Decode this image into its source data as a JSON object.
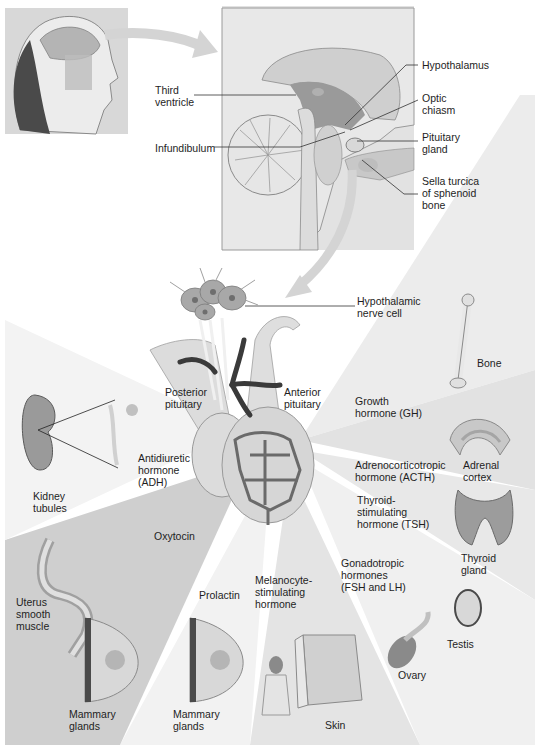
{
  "diagram": {
    "labels": {
      "hypothalamus": "Hypothalamus",
      "third_ventricle": "Third\nventricle",
      "optic_chiasm": "Optic\nchiasm",
      "pituitary_gland": "Pituitary\ngland",
      "infundibulum": "Infundibulum",
      "sella_turcica": "Sella turcica\nof sphenoid\nbone",
      "hypothalamic_nerve_cell": "Hypothalamic\nnerve cell",
      "posterior_pituitary": "Posterior\npituitary",
      "anterior_pituitary": "Anterior\npituitary",
      "bone": "Bone",
      "growth_hormone": "Growth\nhormone (GH)",
      "adrenal_cortex": "Adrenal\ncortex",
      "acth": "Adrenocorticotropic\nhormone (ACTH)",
      "adh": "Antidiuretic\nhormone\n(ADH)",
      "kidney_tubules": "Kidney\ntubules",
      "tsh": "Thyroid-\nstimulating\nhormone (TSH)",
      "thyroid_gland": "Thyroid\ngland",
      "oxytocin": "Oxytocin",
      "gonadotropic": "Gonadotropic\nhormones\n(FSH and LH)",
      "uterus": "Uterus\nsmooth\nmuscle",
      "prolactin": "Prolactin",
      "msh": "Melanocyte-\nstimulating\nhormone",
      "testis": "Testis",
      "ovary": "Ovary",
      "mammary_left": "Mammary\nglands",
      "mammary_right": "Mammary\nglands",
      "skin": "Skin"
    },
    "colors": {
      "wedge_dark": "#c9c9c9",
      "wedge_mid": "#dcdcdc",
      "wedge_light": "#ebebeb",
      "arrow": "#d4d4d4",
      "vessel": "#3a3a3a",
      "tissue": "#d9d9d9"
    }
  }
}
